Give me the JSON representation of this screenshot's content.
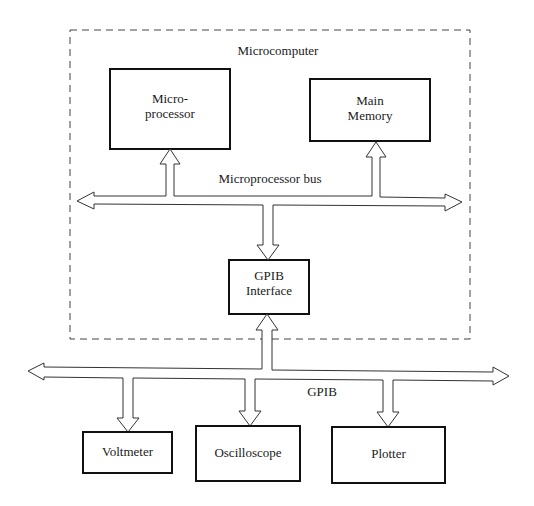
{
  "diagram": {
    "container": {
      "label": "Microcomputer"
    },
    "blocks": {
      "microprocessor": {
        "line1": "Micro-",
        "line2": "processor"
      },
      "main_memory": {
        "line1": "Main",
        "line2": "Memory"
      },
      "gpib_interface": {
        "line1": "GPIB",
        "line2": "Interface"
      },
      "voltmeter": {
        "label": "Voltmeter"
      },
      "oscilloscope": {
        "label": "Oscilloscope"
      },
      "plotter": {
        "label": "Plotter"
      }
    },
    "buses": {
      "microprocessor_bus": {
        "label": "Microprocessor bus"
      },
      "gpib": {
        "label": "GPIB"
      }
    },
    "connections": [
      {
        "from": "microprocessor_bus",
        "to": "microprocessor",
        "type": "bidirectional-to-bus"
      },
      {
        "from": "microprocessor_bus",
        "to": "main_memory",
        "type": "bidirectional-to-bus"
      },
      {
        "from": "microprocessor_bus",
        "to": "gpib_interface",
        "type": "bus-to-block"
      },
      {
        "from": "gpib",
        "to": "gpib_interface",
        "type": "bus-to-block"
      },
      {
        "from": "gpib",
        "to": "voltmeter",
        "type": "bus-to-block"
      },
      {
        "from": "gpib",
        "to": "oscilloscope",
        "type": "bus-to-block"
      },
      {
        "from": "gpib",
        "to": "plotter",
        "type": "bus-to-block"
      }
    ]
  }
}
